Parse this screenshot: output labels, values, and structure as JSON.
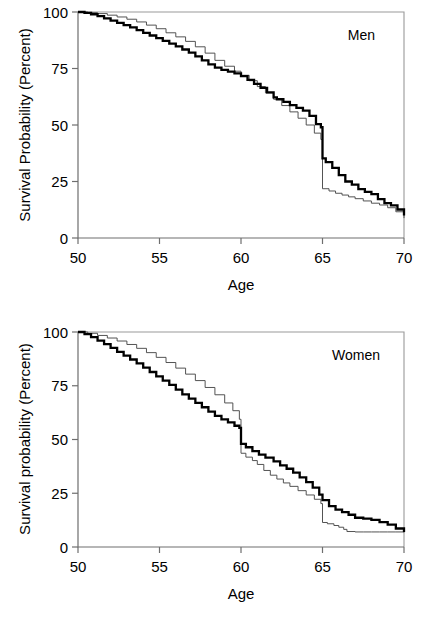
{
  "figure": {
    "panels": [
      "men",
      "women"
    ]
  },
  "chart_data": [
    {
      "type": "line",
      "panel_id": "men",
      "title": "",
      "annotation": "Men",
      "xlabel": "Age",
      "ylabel": "Survival Probability (Percent)",
      "xlim": [
        50,
        70
      ],
      "ylim": [
        0,
        100
      ],
      "xticks": [
        50,
        55,
        60,
        65,
        70
      ],
      "xtick_labels": [
        "50",
        "55",
        "60",
        "65",
        "70"
      ],
      "yticks": [
        0,
        25,
        50,
        75,
        100
      ],
      "ytick_labels": [
        "0",
        "25",
        "50",
        "75",
        "100"
      ],
      "grid": false,
      "legend": "none",
      "series": [
        {
          "name": "thick-curve",
          "style": "thick-black",
          "x": [
            50.0,
            50.4,
            50.8,
            51.2,
            51.6,
            52.0,
            52.4,
            52.8,
            53.2,
            53.6,
            54.0,
            54.4,
            54.8,
            55.2,
            55.6,
            56.0,
            56.4,
            56.8,
            57.2,
            57.6,
            58.0,
            58.4,
            58.8,
            59.2,
            59.6,
            60.0,
            60.4,
            60.8,
            61.2,
            61.6,
            62.0,
            62.2,
            62.6,
            63.0,
            63.4,
            63.8,
            64.2,
            64.6,
            64.9,
            65.0,
            65.2,
            65.6,
            66.0,
            66.4,
            66.8,
            67.2,
            67.6,
            68.0,
            68.4,
            68.8,
            69.2,
            69.6,
            70.0
          ],
          "y": [
            100.0,
            99.6,
            99.0,
            98.2,
            97.2,
            96.2,
            95.2,
            94.2,
            93.2,
            92.0,
            90.8,
            89.6,
            88.4,
            87.2,
            86.0,
            84.8,
            83.4,
            82.0,
            80.4,
            78.6,
            76.8,
            75.4,
            74.4,
            73.6,
            72.8,
            71.6,
            70.0,
            68.2,
            66.4,
            64.4,
            62.2,
            61.4,
            60.2,
            58.8,
            57.6,
            56.4,
            54.0,
            50.4,
            49.0,
            35.2,
            33.6,
            31.0,
            27.8,
            25.0,
            23.6,
            21.6,
            20.4,
            19.4,
            17.2,
            15.4,
            14.4,
            12.6,
            10.0
          ]
        },
        {
          "name": "thin-curve",
          "style": "thin-gray",
          "x": [
            50.0,
            50.6,
            51.2,
            51.8,
            52.4,
            53.0,
            53.6,
            54.2,
            54.8,
            55.4,
            56.0,
            56.6,
            57.2,
            57.8,
            58.4,
            59.0,
            59.6,
            60.0,
            60.5,
            61.0,
            61.5,
            62.0,
            62.5,
            63.0,
            63.5,
            64.0,
            64.5,
            64.9,
            65.0,
            65.4,
            65.8,
            66.2,
            66.6,
            67.0,
            67.5,
            68.0,
            68.5,
            69.0,
            69.5,
            70.0
          ],
          "y": [
            100.0,
            99.7,
            99.3,
            98.6,
            97.8,
            96.8,
            95.6,
            94.2,
            92.6,
            90.8,
            89.0,
            87.0,
            84.6,
            81.8,
            78.6,
            76.0,
            73.8,
            72.0,
            69.6,
            67.0,
            64.2,
            61.4,
            58.6,
            55.8,
            53.0,
            50.0,
            46.4,
            43.6,
            21.8,
            20.8,
            19.8,
            19.0,
            18.2,
            17.4,
            16.4,
            15.4,
            14.6,
            13.4,
            11.6,
            8.8
          ]
        }
      ]
    },
    {
      "type": "line",
      "panel_id": "women",
      "title": "",
      "annotation": "Women",
      "xlabel": "Age",
      "ylabel": "Survival probability (Percent)",
      "xlim": [
        50,
        70
      ],
      "ylim": [
        0,
        100
      ],
      "xticks": [
        50,
        55,
        60,
        65,
        70
      ],
      "xtick_labels": [
        "50",
        "55",
        "60",
        "65",
        "70"
      ],
      "yticks": [
        0,
        25,
        50,
        75,
        100
      ],
      "ytick_labels": [
        "0",
        "25",
        "50",
        "75",
        "100"
      ],
      "grid": false,
      "legend": "none",
      "series": [
        {
          "name": "thick-curve",
          "style": "thick-black",
          "x": [
            50.0,
            50.4,
            50.8,
            51.2,
            51.6,
            52.0,
            52.4,
            52.8,
            53.2,
            53.6,
            54.0,
            54.4,
            54.8,
            55.2,
            55.6,
            56.0,
            56.4,
            56.8,
            57.2,
            57.6,
            58.0,
            58.4,
            58.8,
            59.2,
            59.6,
            59.9,
            60.0,
            60.3,
            60.7,
            61.1,
            61.5,
            62.0,
            62.4,
            62.8,
            63.2,
            63.6,
            64.0,
            64.4,
            64.8,
            65.0,
            65.4,
            65.8,
            66.2,
            66.6,
            67.0,
            67.5,
            68.0,
            68.5,
            69.0,
            69.5,
            70.0
          ],
          "y": [
            100.0,
            99.0,
            97.6,
            96.0,
            94.4,
            92.6,
            90.8,
            89.0,
            87.2,
            85.4,
            83.4,
            81.4,
            79.4,
            77.4,
            75.4,
            73.2,
            71.0,
            69.0,
            67.0,
            65.0,
            63.0,
            61.0,
            59.4,
            58.0,
            56.4,
            55.4,
            48.0,
            46.4,
            44.6,
            43.0,
            41.6,
            39.8,
            38.0,
            36.4,
            34.6,
            32.4,
            30.2,
            27.6,
            24.4,
            21.8,
            19.0,
            17.4,
            16.2,
            15.0,
            13.6,
            13.2,
            12.6,
            11.6,
            10.4,
            8.6,
            7.0
          ]
        },
        {
          "name": "thin-curve",
          "style": "thin-gray",
          "x": [
            50.0,
            50.6,
            51.2,
            51.8,
            52.4,
            53.0,
            53.6,
            54.2,
            54.8,
            55.4,
            56.0,
            56.6,
            57.2,
            57.8,
            58.4,
            59.0,
            59.5,
            59.9,
            60.0,
            60.3,
            60.7,
            61.0,
            61.4,
            61.8,
            62.2,
            62.6,
            63.0,
            63.5,
            64.0,
            64.5,
            64.9,
            65.0,
            65.3,
            65.7,
            66.0,
            66.3,
            66.5,
            67.0,
            67.5,
            68.0,
            68.5,
            69.0,
            69.5,
            70.0
          ],
          "y": [
            100.0,
            99.4,
            98.4,
            97.2,
            95.8,
            94.2,
            92.4,
            90.4,
            88.2,
            85.8,
            83.2,
            80.4,
            77.4,
            74.2,
            70.8,
            67.0,
            63.4,
            59.4,
            43.6,
            41.8,
            40.2,
            38.4,
            35.6,
            33.4,
            31.6,
            29.8,
            28.2,
            26.2,
            24.2,
            22.2,
            20.2,
            11.4,
            10.8,
            10.0,
            9.2,
            8.2,
            7.2,
            7.0,
            7.0,
            7.0,
            7.0,
            7.0,
            7.0,
            6.8
          ]
        }
      ]
    }
  ]
}
